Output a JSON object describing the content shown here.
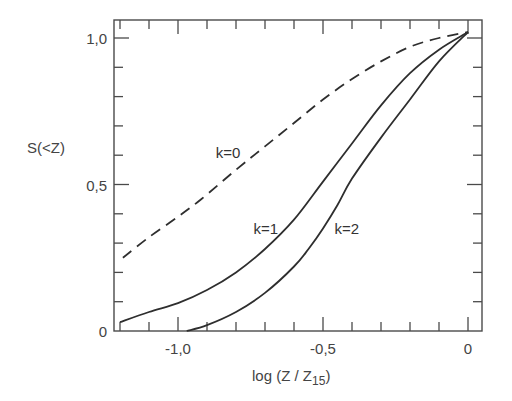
{
  "chart_data": {
    "type": "line",
    "title": "",
    "xlabel": "log (Z / Z15)",
    "xlabel_main": "log (Z / Z",
    "xlabel_sub": "15",
    "xlabel_close": ")",
    "ylabel": "S(<Z)",
    "xlim": [
      -1.22,
      0.05
    ],
    "ylim": [
      0,
      1.06
    ],
    "grid": false,
    "legend": "inline labels",
    "x_ticks": [
      {
        "value": -1.0,
        "label": "-1.0"
      },
      {
        "value": -0.5,
        "label": "-0.5"
      },
      {
        "value": 0,
        "label": "0"
      }
    ],
    "y_ticks": [
      {
        "value": 0,
        "label": "0"
      },
      {
        "value": 0.5,
        "label": "0.5"
      },
      {
        "value": 1.0,
        "label": "1.0"
      }
    ],
    "x_minor_step": 0.1,
    "y_minor_step": 0.1,
    "series": [
      {
        "name": "k=0",
        "label": "k=0",
        "style": "dashed",
        "label_pos": [
          -0.87,
          0.59
        ],
        "x": [
          -1.19,
          -1.1,
          -1.0,
          -0.92,
          -0.8,
          -0.7,
          -0.6,
          -0.5,
          -0.4,
          -0.3,
          -0.2,
          -0.1,
          0.0
        ],
        "y": [
          0.25,
          0.32,
          0.39,
          0.45,
          0.55,
          0.63,
          0.71,
          0.79,
          0.86,
          0.92,
          0.97,
          1.0,
          1.02
        ]
      },
      {
        "name": "k=1",
        "label": "k=1",
        "style": "solid",
        "label_pos": [
          -0.74,
          0.33
        ],
        "x": [
          -1.2,
          -1.1,
          -1.0,
          -0.9,
          -0.8,
          -0.7,
          -0.6,
          -0.5,
          -0.4,
          -0.3,
          -0.2,
          -0.1,
          0.0
        ],
        "y": [
          0.03,
          0.065,
          0.095,
          0.14,
          0.2,
          0.28,
          0.38,
          0.51,
          0.64,
          0.77,
          0.88,
          0.96,
          1.02
        ]
      },
      {
        "name": "k=2",
        "label": "k=2",
        "style": "solid",
        "label_pos": [
          -0.46,
          0.33
        ],
        "x": [
          -0.97,
          -0.9,
          -0.8,
          -0.7,
          -0.6,
          -0.55,
          -0.5,
          -0.45,
          -0.4,
          -0.3,
          -0.2,
          -0.1,
          0.0
        ],
        "y": [
          0.0,
          0.02,
          0.065,
          0.13,
          0.22,
          0.28,
          0.35,
          0.43,
          0.52,
          0.66,
          0.79,
          0.92,
          1.02
        ]
      }
    ]
  }
}
